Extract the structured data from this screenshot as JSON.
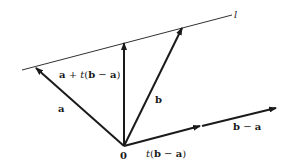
{
  "diagram": {
    "type": "vector-line-parametrization",
    "colors": {
      "stroke": "#1a1a1a",
      "background": "#ffffff"
    },
    "labels": {
      "line": "l",
      "origin": "0",
      "vector_a": "a",
      "vector_b": "b",
      "point_on_line": "a + t(b − a)",
      "scaled_difference": "t(b − a)",
      "difference": "b − a"
    },
    "label_parts": {
      "point_on_line": {
        "a": "a",
        "plus": " + ",
        "t": "t",
        "open": "(",
        "b": "b",
        "minus": " − ",
        "a2": "a",
        "close": ")"
      },
      "scaled_difference": {
        "t": "t",
        "open": "(",
        "b": "b",
        "minus": " − ",
        "a": "a",
        "close": ")"
      },
      "difference": {
        "b": "b",
        "minus": " − ",
        "a": "a"
      }
    },
    "points": {
      "origin": [
        124,
        146
      ],
      "a_tip": [
        36,
        68
      ],
      "point_tip": [
        124,
        43
      ],
      "b_tip": [
        182,
        28
      ],
      "t_diff_tip": [
        200,
        126
      ],
      "diff_tip": [
        276,
        108
      ],
      "line_start": [
        22,
        70
      ],
      "line_end": [
        232,
        15
      ]
    }
  }
}
